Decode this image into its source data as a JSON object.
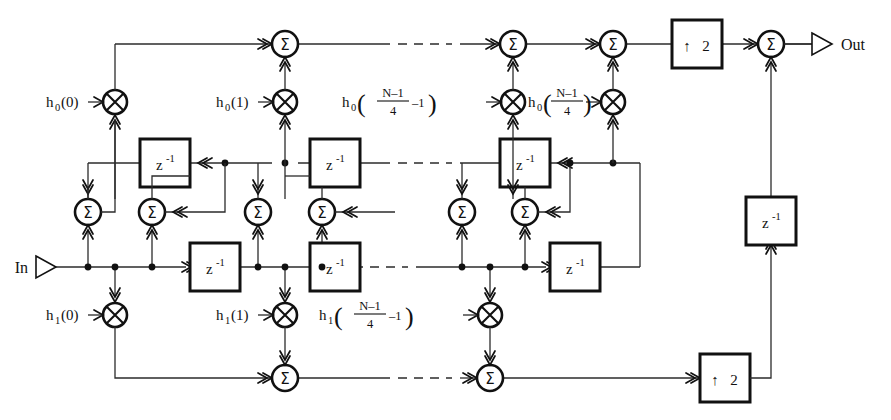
{
  "figure": {
    "type": "block-diagram",
    "domain": "signal-processing"
  },
  "terminals": {
    "input": {
      "label": "In",
      "icon": "input-terminal-triangle"
    },
    "output": {
      "label": "Out",
      "icon": "output-terminal-triangle"
    }
  },
  "symbols": {
    "adder": "Σ",
    "multiplier": "⊗",
    "delay_base": "z",
    "delay_exp": "-1",
    "upsample_arrow": "↑",
    "upsample_factor": "2",
    "ellipsis": "dashed-continuation"
  },
  "coefficients": {
    "top_branch": [
      {
        "name": "h0-0",
        "base": "h",
        "sub": "0",
        "arg": "(0)",
        "kind": "simple"
      },
      {
        "name": "h0-1",
        "base": "h",
        "sub": "0",
        "arg": "(1)",
        "kind": "simple"
      },
      {
        "name": "h0-n-1",
        "base": "h",
        "sub": "0",
        "kind": "fraction-minus",
        "num": "N–1",
        "den": "4",
        "tail": "–1"
      },
      {
        "name": "h0-n",
        "base": "h",
        "sub": "0",
        "kind": "fraction",
        "num": "N–1",
        "den": "4",
        "tail": ""
      }
    ],
    "bottom_branch": [
      {
        "name": "h1-0",
        "base": "h",
        "sub": "1",
        "arg": "(0)",
        "kind": "simple"
      },
      {
        "name": "h1-1",
        "base": "h",
        "sub": "1",
        "arg": "(1)",
        "kind": "simple"
      },
      {
        "name": "h1-n-1",
        "base": "h",
        "sub": "1",
        "kind": "fraction-minus",
        "num": "N–1",
        "den": "4",
        "tail": "–1"
      }
    ]
  },
  "blocks": {
    "upsamplers": [
      {
        "name": "upsampler-top",
        "arrow": "↑",
        "factor": "2"
      },
      {
        "name": "upsampler-bottom",
        "arrow": "↑",
        "factor": "2"
      }
    ],
    "delays_upper": [
      {
        "name": "delay-upper-1"
      },
      {
        "name": "delay-upper-2"
      },
      {
        "name": "delay-upper-3"
      }
    ],
    "delays_lower": [
      {
        "name": "delay-lower-1"
      },
      {
        "name": "delay-lower-2"
      },
      {
        "name": "delay-lower-3"
      }
    ],
    "delay_feedback": {
      "name": "delay-output-feedback"
    }
  },
  "adders": {
    "top_sum_line": [
      {
        "name": "adder-top-1"
      },
      {
        "name": "adder-top-2"
      },
      {
        "name": "adder-top-3"
      },
      {
        "name": "adder-output"
      }
    ],
    "lattice": [
      {
        "name": "adder-lattice-1"
      },
      {
        "name": "adder-lattice-2"
      },
      {
        "name": "adder-lattice-3"
      },
      {
        "name": "adder-lattice-4"
      },
      {
        "name": "adder-lattice-5"
      },
      {
        "name": "adder-lattice-6"
      }
    ],
    "bottom_sum_line": [
      {
        "name": "adder-bottom-1"
      },
      {
        "name": "adder-bottom-2"
      }
    ]
  },
  "colors": {
    "line": "#2b2b2b",
    "stroke": "#111111",
    "background": "#ffffff"
  }
}
